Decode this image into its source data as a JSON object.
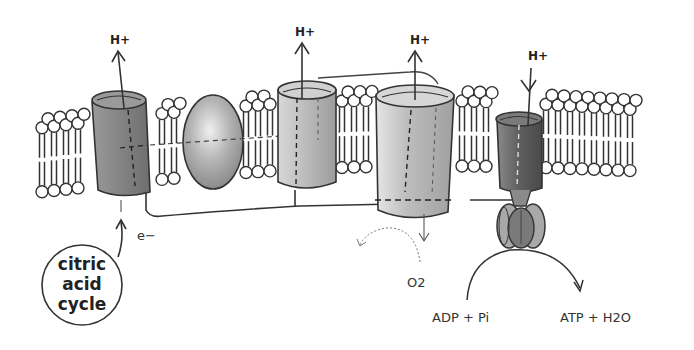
{
  "diagram": {
    "proton_labels": [
      "H+",
      "H+",
      "H+",
      "H+"
    ],
    "electron_label": "e−",
    "citric_acid_cycle": {
      "line1": "citric",
      "line2": "acid",
      "line3": "cycle"
    },
    "oxygen_label": "O2",
    "reactants_label": "ADP + Pi",
    "products_label": "ATP + H2O",
    "colors": {
      "background": "#ffffff",
      "outline": "#333333",
      "protein_dark": "#8a8a8a",
      "protein_mid": "#a8a8a8",
      "protein_light": "#c8c8c8",
      "atp_synthase": "#6e6e6e"
    }
  }
}
